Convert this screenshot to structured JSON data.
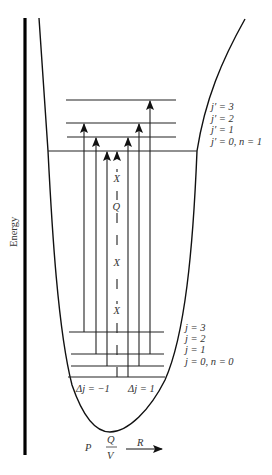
{
  "diagram": {
    "axis_label": "Energy",
    "upper_levels": [
      {
        "label": "j′ = 3",
        "y": 100
      },
      {
        "label": "j′ = 2",
        "y": 123
      },
      {
        "label": "j′ = 1",
        "y": 137
      },
      {
        "label": "j′ = 0, n = 1",
        "y": 151
      }
    ],
    "lower_levels": [
      {
        "label": "j = 3",
        "y": 332
      },
      {
        "label": "j = 2",
        "y": 354
      },
      {
        "label": "j = 1",
        "y": 366
      },
      {
        "label": "j = 0, n = 0",
        "y": 377
      }
    ],
    "transitions": [
      {
        "x": 84,
        "from": "j=3",
        "to": "j'=2",
        "branch": "P"
      },
      {
        "x": 96,
        "from": "j=2",
        "to": "j'=1",
        "branch": "P"
      },
      {
        "x": 107,
        "from": "j=1",
        "to": "j'=0",
        "branch": "P"
      },
      {
        "x": 117,
        "from": "j=0",
        "to": "j'=0",
        "branch": "Q (forbidden)",
        "dashed": true
      },
      {
        "x": 128,
        "from": "j=0",
        "to": "j'=1",
        "branch": "R"
      },
      {
        "x": 139,
        "from": "j=1",
        "to": "j'=2",
        "branch": "R"
      },
      {
        "x": 150,
        "from": "j=2",
        "to": "j'=3",
        "branch": "R"
      }
    ],
    "dashed_markers": [
      "X",
      "Q",
      "X",
      "X"
    ],
    "delta_labels": {
      "left": "Δj = −1",
      "right": "Δj = 1"
    },
    "branch_labels": {
      "p": "P",
      "q": "Q",
      "v": "V",
      "r": "R"
    }
  }
}
